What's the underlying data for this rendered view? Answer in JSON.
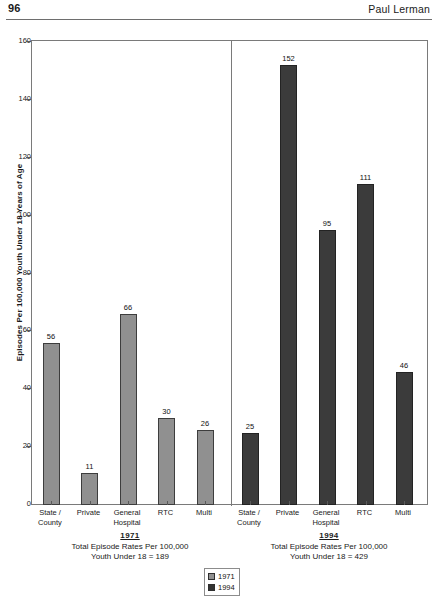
{
  "page": {
    "folio": "96",
    "running_head": "Paul Lerman"
  },
  "chart_data": {
    "type": "bar",
    "title": "",
    "xlabel": "",
    "ylabel": "Episodes Per 100,000 Youth Under 18 Years of Age",
    "ylim": [
      0,
      160
    ],
    "y_ticks": [
      "0",
      "20",
      "40",
      "60",
      "80",
      "100",
      "120",
      "140",
      "160"
    ],
    "grid": false,
    "legend_position": "bottom-center",
    "categories": [
      "State / County",
      "Private",
      "General Hospital",
      "RTC",
      "Multi"
    ],
    "series": [
      {
        "name": "1971",
        "color": "#909090",
        "values": [
          56,
          11,
          66,
          30,
          26
        ]
      },
      {
        "name": "1994",
        "color": "#3b3b3b",
        "values": [
          25,
          152,
          95,
          111,
          46
        ]
      }
    ],
    "panels": [
      {
        "series": "1971",
        "caption_year": "1971",
        "caption_line1": "Total Episode Rates Per 100,000",
        "caption_line2": "Youth Under 18 = 189",
        "categories": [
          {
            "line1": "State /",
            "line2": "County",
            "value": 56
          },
          {
            "line1": "Private",
            "line2": "",
            "value": 11
          },
          {
            "line1": "General",
            "line2": "Hospital",
            "value": 66
          },
          {
            "line1": "RTC",
            "line2": "",
            "value": 30
          },
          {
            "line1": "Multi",
            "line2": "",
            "value": 26
          }
        ]
      },
      {
        "series": "1994",
        "caption_year": "1994",
        "caption_line1": "Total Episode Rates Per 100,000",
        "caption_line2": "Youth Under 18 = 429",
        "categories": [
          {
            "line1": "State /",
            "line2": "County",
            "value": 25
          },
          {
            "line1": "Private",
            "line2": "",
            "value": 152
          },
          {
            "line1": "General",
            "line2": "Hospital",
            "value": 95
          },
          {
            "line1": "RTC",
            "line2": "",
            "value": 111
          },
          {
            "line1": "Multi",
            "line2": "",
            "value": 46
          }
        ]
      }
    ],
    "legend": [
      {
        "label": "1971",
        "color": "#909090"
      },
      {
        "label": "1994",
        "color": "#3b3b3b"
      }
    ]
  }
}
